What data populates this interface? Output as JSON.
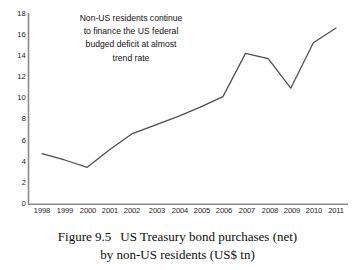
{
  "chart_data": {
    "type": "line",
    "title": "",
    "xlabel": "",
    "ylabel": "",
    "categories": [
      "1998",
      "1999",
      "2000",
      "2001",
      "2002",
      "2003",
      "2004",
      "2005",
      "2006",
      "2007",
      "2008",
      "2009",
      "2010",
      "2011"
    ],
    "values": [
      4.8,
      4.2,
      3.5,
      5.2,
      6.7,
      7.5,
      8.3,
      9.2,
      10.2,
      14.3,
      13.8,
      11.0,
      15.3,
      16.7
    ],
    "series": [
      {
        "name": "US Treasury bond purchases (net) by non-US residents",
        "values": [
          4.8,
          4.2,
          3.5,
          5.2,
          6.7,
          7.5,
          8.3,
          9.2,
          10.2,
          14.3,
          13.8,
          11.0,
          15.3,
          16.7
        ]
      }
    ],
    "ylim": [
      0,
      18
    ],
    "ytick_values": [
      0,
      2,
      4,
      6,
      8,
      10,
      12,
      14,
      16,
      18
    ],
    "ytick_labels": [
      "0",
      "2",
      "4",
      "6",
      "8",
      "10",
      "12",
      "14",
      "16",
      "18"
    ],
    "xtick_labels": [
      "1998",
      "1999",
      "2000",
      "2001",
      "2002",
      "2003",
      "2004",
      "2005",
      "2006",
      "2007",
      "2008",
      "2009",
      "2010",
      "2011"
    ],
    "grid": false,
    "legend": false,
    "legend_position": "none",
    "line_color": "#4d4d4d",
    "axis_color": "#808080",
    "annotations": [
      {
        "name": "trend-note",
        "lines": [
          "Non-US residents continue",
          "to finance the US federal",
          "budged deficit at almost",
          "trend rate"
        ]
      }
    ]
  },
  "annotation": {
    "line1": "Non-US residents continue",
    "line2": "to finance the US federal",
    "line3": "budged deficit at almost",
    "line4": "trend rate"
  },
  "caption": {
    "figure_number": "Figure 9.5",
    "line1": "US Treasury bond purchases (net)",
    "line2": "by non-US residents (US$ tn)"
  }
}
